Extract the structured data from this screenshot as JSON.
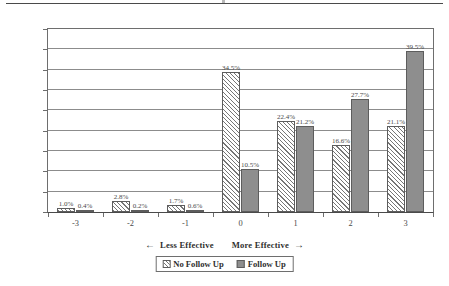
{
  "chart_data": {
    "type": "bar",
    "title": "",
    "xlabel": "",
    "ylabel": "",
    "categories": [
      "-3",
      "-2",
      "-1",
      "0",
      "1",
      "2",
      "3"
    ],
    "series": [
      {
        "name": "No Follow Up",
        "values": [
          1.0,
          2.8,
          1.7,
          34.5,
          22.4,
          16.6,
          21.1
        ],
        "labels": [
          "1.0%",
          "2.8%",
          "1.7%",
          "34.5%",
          "22.4%",
          "16.6%",
          "21.1%"
        ],
        "pattern": "diagonal-hatch",
        "color": "#ffffff",
        "edge_color": "#5d5d5d"
      },
      {
        "name": "Follow Up",
        "values": [
          0.4,
          0.2,
          0.6,
          10.5,
          21.2,
          27.7,
          39.5
        ],
        "labels": [
          "0.4%",
          "0.2%",
          "0.6%",
          "10.5%",
          "21.2%",
          "27.7%",
          "39.5%"
        ],
        "pattern": "solid",
        "color": "#8e8e8e",
        "edge_color": "#5d5d5d"
      }
    ],
    "ylim": [
      0,
      45
    ],
    "ytick_labels": [
      "0.0%",
      "5.0%",
      "10.0%",
      "15.0%",
      "20.0%",
      "25.0%",
      "30.0%",
      "35.0%",
      "40.0%",
      "45.0%"
    ],
    "ytick_values": [
      0,
      5,
      10,
      15,
      20,
      25,
      30,
      35,
      40,
      45
    ],
    "grid": true,
    "legend_position": "bottom",
    "annotations": {
      "axis_caption_less": "Less Effective",
      "axis_caption_more": "More Effective",
      "arrow_left": "←",
      "arrow_right": "→"
    }
  }
}
